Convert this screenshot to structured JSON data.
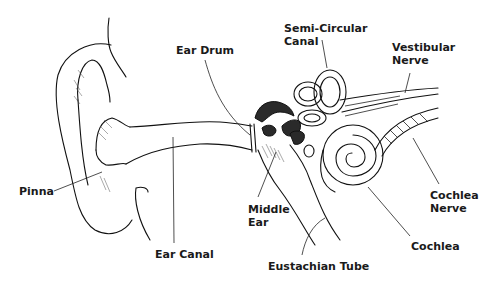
{
  "diagram": {
    "labels": [
      {
        "id": "ear-drum",
        "text": "Ear Drum"
      },
      {
        "id": "semi-circular-canal",
        "text": "Semi-Circular\nCanal"
      },
      {
        "id": "vestibular-nerve",
        "text": "Vestibular\nNerve"
      },
      {
        "id": "pinna",
        "text": "Pinna"
      },
      {
        "id": "middle-ear",
        "text": "Middle\nEar"
      },
      {
        "id": "ear-canal",
        "text": "Ear Canal"
      },
      {
        "id": "cochlea-nerve",
        "text": "Cochlea\nNerve"
      },
      {
        "id": "cochlea",
        "text": "Cochlea"
      },
      {
        "id": "eustachian-tube",
        "text": "Eustachian Tube"
      }
    ]
  }
}
